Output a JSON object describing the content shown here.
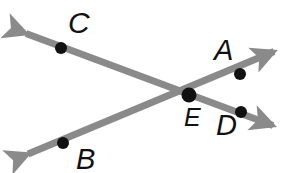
{
  "figure": {
    "type": "geometry-diagram",
    "width": 295,
    "height": 173,
    "background_color": "#ffffff",
    "line_color": "#8a8a8a",
    "point_color": "#111111",
    "label_color": "#111111",
    "line_width": 7,
    "point_radius": 6,
    "intersection_point_radius": 7.5,
    "labels": {
      "A": "A",
      "B": "B",
      "C": "C",
      "D": "D",
      "E": "E"
    },
    "points": [
      {
        "name": "C",
        "x": 61,
        "y": 48,
        "radius": 6
      },
      {
        "name": "B",
        "x": 63,
        "y": 143,
        "radius": 6
      },
      {
        "name": "A",
        "x": 240,
        "y": 74,
        "radius": 6
      },
      {
        "name": "D",
        "x": 241,
        "y": 112,
        "radius": 6
      },
      {
        "name": "E",
        "x": 189,
        "y": 95,
        "radius": 7.5
      }
    ],
    "lines": [
      {
        "name": "line-CD",
        "through": [
          "C",
          "E",
          "D"
        ],
        "start_arrow_tip": {
          "x": 12,
          "y": 28
        },
        "end_arrow_tip": {
          "x": 287,
          "y": 131
        },
        "double_headed": true
      },
      {
        "name": "line-BA",
        "through": [
          "B",
          "E",
          "A"
        ],
        "start_arrow_tip": {
          "x": 14,
          "y": 160
        },
        "end_arrow_tip": {
          "x": 288,
          "y": 46
        },
        "double_headed": true
      }
    ]
  }
}
